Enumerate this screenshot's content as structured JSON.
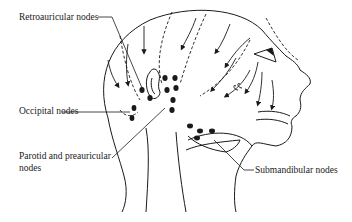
{
  "diagram": {
    "labels": {
      "retroauricular": "Retroauricular nodes",
      "occipital": "Occipital nodes",
      "parotid_line1": "Parotid and preauricular",
      "parotid_line2": "nodes",
      "submandibular": "Submandibular nodes"
    },
    "colors": {
      "ink": "#1a1a1a",
      "background": "#ffffff"
    }
  }
}
